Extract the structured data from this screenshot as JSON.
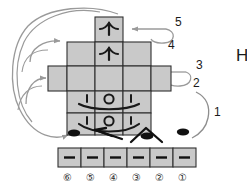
{
  "diagram": {
    "background_color": "#ffffff",
    "cell_fill": "#c9c9c9",
    "cell_stroke": "#303030",
    "arrow_color": "#9a9a9a",
    "ink_color": "#1a1a1a",
    "step_labels": [
      {
        "text": "1",
        "x": 214,
        "y": 112
      },
      {
        "text": "2",
        "x": 193,
        "y": 83
      },
      {
        "text": "3",
        "x": 196,
        "y": 65
      },
      {
        "text": "4",
        "x": 168,
        "y": 45
      },
      {
        "text": "5",
        "x": 175,
        "y": 22
      }
    ],
    "side_letter": {
      "text": "H",
      "x": 236,
      "y": 55
    },
    "net": {
      "description": "cross-shaped net of gray square cells",
      "cells": [
        {
          "name": "top-cell",
          "x": 95,
          "y": 17,
          "w": 28,
          "h": 25,
          "glyph": "plane-up"
        },
        {
          "name": "upper-cell",
          "x": 95,
          "y": 42,
          "w": 28,
          "h": 24,
          "glyph": "plane-up"
        },
        {
          "name": "upper-left-cell",
          "x": 67,
          "y": 42,
          "w": 28,
          "h": 24,
          "glyph": "none"
        },
        {
          "name": "upper-right-cell",
          "x": 123,
          "y": 42,
          "w": 28,
          "h": 24,
          "glyph": "none"
        },
        {
          "name": "mid-left-far-cell",
          "x": 48,
          "y": 66,
          "w": 19,
          "h": 25,
          "glyph": "none"
        },
        {
          "name": "mid-left-cell",
          "x": 67,
          "y": 66,
          "w": 28,
          "h": 25,
          "glyph": "none"
        },
        {
          "name": "mid-center-cell",
          "x": 95,
          "y": 66,
          "w": 28,
          "h": 25,
          "glyph": "none"
        },
        {
          "name": "mid-right-cell",
          "x": 123,
          "y": 66,
          "w": 28,
          "h": 25,
          "glyph": "none"
        },
        {
          "name": "mid-right-far-cell",
          "x": 151,
          "y": 66,
          "w": 20,
          "h": 25,
          "glyph": "none"
        },
        {
          "name": "face-row-left-cell",
          "x": 67,
          "y": 91,
          "w": 28,
          "h": 22,
          "glyph": "eye-left"
        },
        {
          "name": "face-row-center-cell",
          "x": 95,
          "y": 91,
          "w": 28,
          "h": 22,
          "glyph": "nose"
        },
        {
          "name": "face-row-right-cell",
          "x": 123,
          "y": 91,
          "w": 28,
          "h": 22,
          "glyph": "eye-right"
        },
        {
          "name": "lower-left-cell",
          "x": 67,
          "y": 113,
          "w": 28,
          "h": 22,
          "glyph": "eye-left"
        },
        {
          "name": "lower-center-cell",
          "x": 95,
          "y": 113,
          "w": 28,
          "h": 22,
          "glyph": "nose"
        },
        {
          "name": "lower-right-cell",
          "x": 123,
          "y": 113,
          "w": 28,
          "h": 22,
          "glyph": "eye-right"
        }
      ]
    },
    "strip": {
      "description": "row of six gray cells each containing a dash",
      "x": 58,
      "y": 148,
      "cell_w": 23,
      "cell_h": 19,
      "count": 6,
      "cell_glyph": "dash",
      "numbers": [
        {
          "text": "⑥",
          "value": 6,
          "x": 63
        },
        {
          "text": "⑤",
          "value": 5,
          "x": 86
        },
        {
          "text": "④",
          "value": 4,
          "x": 109
        },
        {
          "text": "③",
          "value": 3,
          "x": 132
        },
        {
          "text": "②",
          "value": 2,
          "x": 155
        },
        {
          "text": "①",
          "value": 1,
          "x": 178
        }
      ],
      "number_row_y": 173
    },
    "loose_marks": [
      {
        "name": "dot-left",
        "type": "filled-ellipse",
        "cx": 74,
        "cy": 133
      },
      {
        "name": "left-arrow-mark",
        "type": "arrow-left",
        "cx": 108,
        "cy": 134
      },
      {
        "name": "peak-with-dot",
        "type": "peak-ellipse",
        "cx": 146,
        "cy": 134
      },
      {
        "name": "dot-right",
        "type": "filled-ellipse",
        "cx": 183,
        "cy": 132
      }
    ]
  }
}
